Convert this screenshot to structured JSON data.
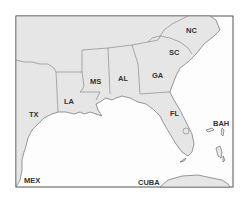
{
  "map": {
    "type": "regional reference map",
    "region": "Southeastern United States",
    "colors": {
      "land": "#e6e6e6",
      "water": "#fdfdfd",
      "border": "#6e6e6e",
      "label": "#333333"
    },
    "labels": {
      "nc": "NC",
      "sc": "SC",
      "ga": "GA",
      "al": "AL",
      "ms": "MS",
      "la": "LA",
      "tx": "TX",
      "fl": "FL",
      "bah": "BAH",
      "mex": "MEX",
      "cuba": "CUBA"
    }
  }
}
